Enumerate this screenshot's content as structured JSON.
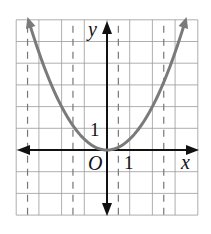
{
  "graph": {
    "function": "y = 0.5x^2",
    "x_range": [
      -4,
      4
    ],
    "y_range": [
      -3,
      6
    ],
    "grid_dashed_x": [
      -3.5,
      -1.5,
      0.5,
      2.5
    ],
    "labels": {
      "y_axis": "y",
      "x_axis": "x",
      "origin": "O",
      "x_tick": "1",
      "y_tick": "1"
    },
    "colors": {
      "grid": "#9a9a9a",
      "axis": "#111111",
      "curve": "#7a7a7a",
      "dashed": "#777777"
    }
  }
}
